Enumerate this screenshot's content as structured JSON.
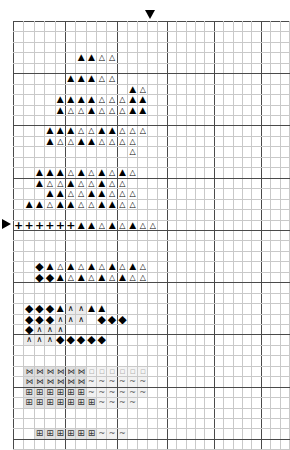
{
  "chart": {
    "type": "stitch-grid",
    "columns": 28,
    "rows": 41,
    "cell_px": 9.45,
    "origin_x_px": 13,
    "origin_y_px": 21,
    "bold_every": 5,
    "grid_line_color": "#c9c9c9",
    "bold_line_color": "#4a4a4a",
    "background": "#ffffff"
  },
  "markers": {
    "top": {
      "name": "center-marker-top",
      "glyph": "▼",
      "col": 14
    },
    "left": {
      "name": "center-marker-left",
      "glyph": "▶",
      "row": 21
    }
  },
  "legend": {
    "TF": {
      "glyph": "▲",
      "label": "filled-triangle",
      "color": "#000000"
    },
    "TO": {
      "glyph": "△",
      "label": "open-triangle",
      "color": "#000000"
    },
    "PL": {
      "glyph": "+",
      "label": "plus",
      "color": "#000000"
    },
    "DI": {
      "glyph": "◆",
      "label": "filled-diamond",
      "color": "#000000"
    },
    "CA": {
      "glyph": "∧",
      "label": "caret",
      "color": "#000000"
    },
    "BP": {
      "glyph": "⊞",
      "label": "boxed-plus",
      "color": "#3a3a3a"
    },
    "CH": {
      "glyph": "⋈",
      "label": "chain-link",
      "color": "#2e2e2e"
    },
    "TI": {
      "glyph": "~",
      "label": "tilde",
      "color": "#555555"
    },
    "DT": {
      "glyph": "▫",
      "label": "faint-dot",
      "color": "#b4b4b4"
    }
  },
  "grid": [
    "............................",
    "............................",
    ".............TFTF...........",
    "............TFTFTOTO.TO.....",
    "...........TFTOTOTOTOTO.....",
    "..........TFTFTFTOTO........",
    ".........TFTFTFTOTOTF.TFTO..",
    "........TFTFTFTFTOTOTOTFTF..",
    "........TFTOTOTFTOTOTOTFTF..",
    ".......TFTFTFTOTFTOTOTOTF...",
    "......TFTFTFTOTOTFTFTOTOTO..",
    "......TFTOTOTFTFTOTOTOTO....",
    ".....TFTFTOTFTOTFTOTO.TO....",
    ".....TFTOTFTOTOTOTOTOTOTO...",
    "....TFTFTFTOTFTOTFTOTFTO....",
    "....TFTOTOTFTOTOTFTOTO.TO...",
    "...TF.TFTFTOTOTFTFTOTOTO....",
    "..TFTFTOTFTFTOTOTFTFTOTO....",
    "...TFTOTFTOTOTFTOTOTOTFTO...",
    "PLPLPLPLPLPLTFTFTOTFTOTFTOTO",
    ".DIDIPLPLPLDITFTOTOTFTFTOTO.",
    "...DIDIPLDITFTOTFTOTFTFTOTOTO",
    ".....DIDITFTOTOTFTOTOTFTOTOTO",
    "....DITFTOTFTOTFTOTFTOTFTO..",
    "....DIDITFTOTFTOTFTOTFTOTO..",
    "...DITFTOTFTOTFTFTOTOTO.....",
    "...DIDITFTOTOTFTOTFTO.......",
    "..DIDIDITFCACATFTF..........",
    "..DIDIDICACACA..DIDIDI......",
    "..DICACACA.DIDIDIDIDI.......",
    "..CACACADIDIDIDIDI..........",
    ".CACADI.....................",
    ".BPBPBPBPBPBPBPBPTITITITITITI",
    "..CHCHCHCHCHCHDTDTDTDTDTDT..",
    "..CHCHCHCHCHCHTITITITITITI..",
    "..BPBPBPBPBPBPTITITITITITI..",
    "..BPBPBPBPBPBPBPTITITITI....",
    ".CHCHCHCHCHCHCHCHCHTITITI...",
    "...BPBPBPBPBPBPBPTITITI.....",
    "....BPBPBPBPBPBPTITITI......",
    ".....BPBPBPBPBPBP..........."
  ]
}
